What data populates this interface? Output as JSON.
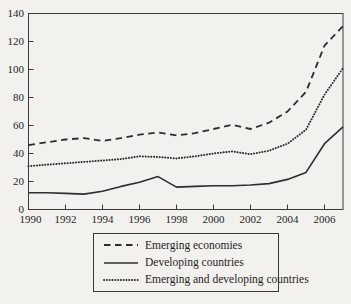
{
  "figure": {
    "background_color": "#f2f1ee",
    "line_color": "#2e2e2e",
    "text_color": "#1e1e1e",
    "frame_color": "#3a3a3a"
  },
  "chart_data": {
    "type": "line",
    "title": "",
    "xlabel": "",
    "ylabel": "",
    "xlim": [
      1990,
      2007
    ],
    "ylim": [
      0,
      140
    ],
    "y_ticks": [
      0,
      20,
      40,
      60,
      80,
      100,
      120,
      140
    ],
    "x_ticks": [
      1990,
      1992,
      1994,
      1996,
      1998,
      2000,
      2002,
      2004,
      2006
    ],
    "grid": "off",
    "legend_position": "below-boxed",
    "x": [
      1990,
      1991,
      1992,
      1993,
      1994,
      1995,
      1996,
      1997,
      1998,
      1999,
      2000,
      2001,
      2002,
      2003,
      2004,
      2005,
      2006,
      2007
    ],
    "series": [
      {
        "name": "Emerging economies",
        "style": "dashed",
        "values": [
          46,
          48,
          50,
          51,
          49,
          51,
          53.5,
          55,
          53,
          54.5,
          57.5,
          60.5,
          57.5,
          62,
          70,
          84,
          117,
          131
        ]
      },
      {
        "name": "Developing countries",
        "style": "solid",
        "values": [
          12,
          12,
          11.5,
          11,
          13,
          16.5,
          19.5,
          23.5,
          16,
          16.5,
          17,
          17,
          17.5,
          18.5,
          21.5,
          26.5,
          47,
          59
        ]
      },
      {
        "name": "Emerging and developing countries",
        "style": "dotted",
        "values": [
          31,
          32,
          33,
          34,
          35,
          36,
          38,
          37.5,
          36.5,
          38,
          40,
          41.5,
          39.5,
          42,
          47,
          57,
          82,
          101
        ]
      }
    ]
  }
}
